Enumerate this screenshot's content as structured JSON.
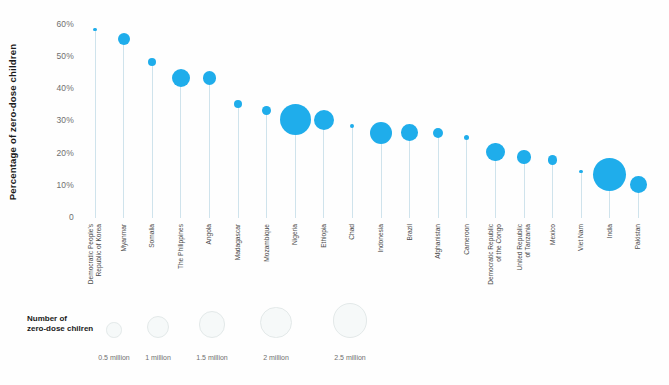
{
  "colors": {
    "bubble": "#1FADEB",
    "stem": "#CFE3EC",
    "axis_text": "#6F6F6F",
    "label_text": "#4C4C4C",
    "title_text": "#1A1A1A",
    "legend_circle_border": "#E3E9E9",
    "legend_circle_fill": "#F6F9F9"
  },
  "chart_data": {
    "type": "bubble",
    "title": "",
    "ylabel": "Percentage of zero-dose children",
    "xlabel": "",
    "ylim": [
      0,
      60
    ],
    "grid": false,
    "yticks": [
      {
        "value": 60,
        "label": "60%"
      },
      {
        "value": 50,
        "label": "50%"
      },
      {
        "value": 40,
        "label": "40%"
      },
      {
        "value": 30,
        "label": "30%"
      },
      {
        "value": 20,
        "label": "20%"
      },
      {
        "value": 10,
        "label": "10%"
      },
      {
        "value": 0,
        "label": "0"
      }
    ],
    "points": [
      {
        "country": "Democratic People's Republic of Korea",
        "label": "Democratic People's\nRepublic of Korea",
        "percent": 58,
        "zero_dose_children_millions": 0.02
      },
      {
        "country": "Myanmar",
        "label": "Myanmar",
        "percent": 55,
        "zero_dose_children_millions": 0.3
      },
      {
        "country": "Somalia",
        "label": "Somalia",
        "percent": 48,
        "zero_dose_children_millions": 0.14
      },
      {
        "country": "The Philippines",
        "label": "The Philippines",
        "percent": 43,
        "zero_dose_children_millions": 0.68
      },
      {
        "country": "Angola",
        "label": "Angola",
        "percent": 43,
        "zero_dose_children_millions": 0.37
      },
      {
        "country": "Madagascar",
        "label": "Madagascar",
        "percent": 35,
        "zero_dose_children_millions": 0.13
      },
      {
        "country": "Mozambique",
        "label": "Mozambique",
        "percent": 33,
        "zero_dose_children_millions": 0.16
      },
      {
        "country": "Nigeria",
        "label": "Nigeria",
        "percent": 30,
        "zero_dose_children_millions": 2.0
      },
      {
        "country": "Ethiopia",
        "label": "Ethiopia",
        "percent": 30,
        "zero_dose_children_millions": 0.83
      },
      {
        "country": "Chad",
        "label": "Chad",
        "percent": 28,
        "zero_dose_children_millions": 0.03
      },
      {
        "country": "Indonesia",
        "label": "Indonesia",
        "percent": 26,
        "zero_dose_children_millions": 1.0
      },
      {
        "country": "Brazil",
        "label": "Brazil",
        "percent": 26,
        "zero_dose_children_millions": 0.57
      },
      {
        "country": "Afghanistan",
        "label": "Afghanistan",
        "percent": 26,
        "zero_dose_children_millions": 0.23
      },
      {
        "country": "Cameroon",
        "label": "Cameroon",
        "percent": 24.5,
        "zero_dose_children_millions": 0.06
      },
      {
        "country": "Democratic Republic of the Congo",
        "label": "Democratic Republic\nof the Congo",
        "percent": 20,
        "zero_dose_children_millions": 0.73
      },
      {
        "country": "United Republic of Tanzania",
        "label": "United Republic\nof Tanzania",
        "percent": 18.5,
        "zero_dose_children_millions": 0.37
      },
      {
        "country": "Mexico",
        "label": "Mexico",
        "percent": 17.5,
        "zero_dose_children_millions": 0.18
      },
      {
        "country": "Viet Nam",
        "label": "Viet Nam",
        "percent": 14,
        "zero_dose_children_millions": 0.03
      },
      {
        "country": "India",
        "label": "India",
        "percent": 13,
        "zero_dose_children_millions": 2.3
      },
      {
        "country": "Pakistan",
        "label": "Pakistan",
        "percent": 10,
        "zero_dose_children_millions": 0.58
      }
    ],
    "size_legend": {
      "title": "Number of\nzero-dose chilren",
      "items": [
        {
          "label": "0.5 million",
          "value_millions": 0.5
        },
        {
          "label": "1 million",
          "value_millions": 1.0
        },
        {
          "label": "1.5 million",
          "value_millions": 1.5
        },
        {
          "label": "2 million",
          "value_millions": 2.0
        },
        {
          "label": "2.5 million",
          "value_millions": 2.5
        }
      ]
    }
  }
}
